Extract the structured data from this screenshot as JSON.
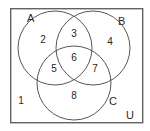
{
  "diagram": {
    "universe_label": "U",
    "sets": [
      {
        "id": "A",
        "label": "A",
        "cx": 55,
        "cy": 48,
        "r": 37,
        "label_x": 27,
        "label_y": 22
      },
      {
        "id": "B",
        "label": "B",
        "cx": 93,
        "cy": 48,
        "r": 37,
        "label_x": 118,
        "label_y": 25
      },
      {
        "id": "C",
        "label": "C",
        "cx": 74,
        "cy": 83,
        "r": 37,
        "label_x": 109,
        "label_y": 105
      }
    ],
    "universe": {
      "label": "U",
      "x": 10,
      "y": 8,
      "width": 133,
      "height": 115,
      "label_x": 130,
      "label_y": 118
    },
    "regions": [
      {
        "id": "outside",
        "label": "1",
        "x": 21,
        "y": 101,
        "description": "outside all sets"
      },
      {
        "id": "A-only",
        "label": "2",
        "x": 43,
        "y": 40,
        "description": "A only"
      },
      {
        "id": "A-B",
        "label": "3",
        "x": 74,
        "y": 34,
        "description": "A and B only"
      },
      {
        "id": "B-only",
        "label": "4",
        "x": 110,
        "y": 42,
        "description": "B only"
      },
      {
        "id": "A-C",
        "label": "5",
        "x": 54,
        "y": 69,
        "description": "A and C only"
      },
      {
        "id": "A-B-C",
        "label": "6",
        "x": 74,
        "y": 58,
        "description": "A and B and C"
      },
      {
        "id": "B-C",
        "label": "7",
        "x": 95,
        "y": 69,
        "description": "B and C only"
      },
      {
        "id": "C-only",
        "label": "8",
        "x": 74,
        "y": 96,
        "description": "C only"
      }
    ]
  },
  "colors": {
    "stroke": "#575757",
    "box_stroke": "#636363",
    "text": "#1f1f1f",
    "background": "#ffffff"
  }
}
